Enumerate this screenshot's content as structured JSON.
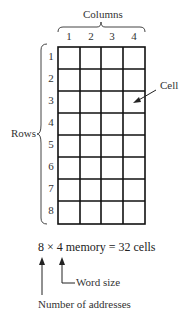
{
  "diagram": {
    "columns_label": "Columns",
    "rows_label": "Rows",
    "cell_label": "Cell",
    "column_numbers": [
      "1",
      "2",
      "3",
      "4"
    ],
    "row_numbers": [
      "1",
      "2",
      "3",
      "4",
      "5",
      "6",
      "7",
      "8"
    ],
    "grid": {
      "rows": 8,
      "cols": 4
    },
    "equation": "8 × 4 memory = 32 cells",
    "word_size_label": "Word size",
    "addresses_label": "Number of addresses"
  }
}
